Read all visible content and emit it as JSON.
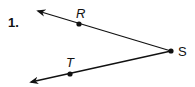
{
  "problem": {
    "number": "1.",
    "description": "Angle formed by rays SR and ST with vertex S"
  },
  "diagram": {
    "vertex": {
      "label": "S",
      "x": 171,
      "y": 51
    },
    "points": [
      {
        "label": "R",
        "x": 79,
        "y": 24,
        "label_x": 76,
        "label_y": 18
      },
      {
        "label": "T",
        "x": 70,
        "y": 74,
        "label_x": 66,
        "label_y": 67
      }
    ],
    "rays": [
      {
        "name": "ray-SR",
        "from": "S",
        "through": "R",
        "tip_x": 37,
        "tip_y": 11
      },
      {
        "name": "ray-ST",
        "from": "S",
        "through": "T",
        "tip_x": 30,
        "tip_y": 82
      }
    ],
    "colors": {
      "stroke": "#111111",
      "background": "#ffffff"
    }
  }
}
